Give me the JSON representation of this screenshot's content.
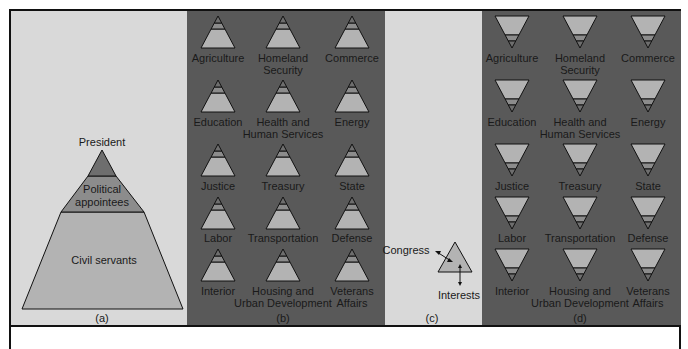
{
  "colors": {
    "light_bg": "#d9d9d9",
    "dark_bg": "#595959",
    "top_band": "#6e6e6e",
    "mid_band": "#8c8c8c",
    "base_band": "#b3b3b3",
    "outline": "#111111"
  },
  "panel_a": {
    "caption": "(a)",
    "levels": [
      {
        "label": "President"
      },
      {
        "label_line1": "Political",
        "label_line2": "appointees"
      },
      {
        "label": "Civil servants"
      }
    ]
  },
  "panel_b": {
    "caption": "(b)",
    "departments": [
      {
        "line1": "Agriculture",
        "line2": ""
      },
      {
        "line1": "Homeland",
        "line2": "Security"
      },
      {
        "line1": "Commerce",
        "line2": ""
      },
      {
        "line1": "Education",
        "line2": ""
      },
      {
        "line1": "Health and",
        "line2": "Human Services"
      },
      {
        "line1": "Energy",
        "line2": ""
      },
      {
        "line1": "Justice",
        "line2": ""
      },
      {
        "line1": "Treasury",
        "line2": ""
      },
      {
        "line1": "State",
        "line2": ""
      },
      {
        "line1": "Labor",
        "line2": ""
      },
      {
        "line1": "Transportation",
        "line2": ""
      },
      {
        "line1": "Defense",
        "line2": ""
      },
      {
        "line1": "Interior",
        "line2": ""
      },
      {
        "line1": "Housing and",
        "line2": "Urban Development"
      },
      {
        "line1": "Veterans",
        "line2": "Affairs"
      }
    ]
  },
  "panel_c": {
    "caption": "(c)",
    "labels": {
      "congress": "Congress",
      "interests": "Interests"
    }
  },
  "panel_d": {
    "caption": "(d)",
    "departments": [
      {
        "line1": "Agriculture",
        "line2": ""
      },
      {
        "line1": "Homeland",
        "line2": "Security"
      },
      {
        "line1": "Commerce",
        "line2": ""
      },
      {
        "line1": "Education",
        "line2": ""
      },
      {
        "line1": "Health and",
        "line2": "Human Services"
      },
      {
        "line1": "Energy",
        "line2": ""
      },
      {
        "line1": "Justice",
        "line2": ""
      },
      {
        "line1": "Treasury",
        "line2": ""
      },
      {
        "line1": "State",
        "line2": ""
      },
      {
        "line1": "Labor",
        "line2": ""
      },
      {
        "line1": "Transportation",
        "line2": ""
      },
      {
        "line1": "Defense",
        "line2": ""
      },
      {
        "line1": "Interior",
        "line2": ""
      },
      {
        "line1": "Housing and",
        "line2": "Urban Development"
      },
      {
        "line1": "Veterans",
        "line2": "Affairs"
      }
    ]
  }
}
